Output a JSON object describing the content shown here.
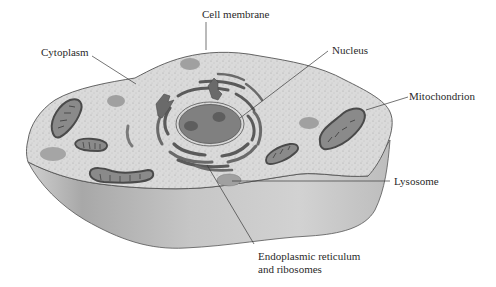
{
  "diagram": {
    "labels": {
      "cell_membrane": "Cell membrane",
      "cytoplasm": "Cytoplasm",
      "nucleus": "Nucleus",
      "mitochondrion": "Mitochondrion",
      "lysosome": "Lysosome",
      "er_line1": "Endoplasmic reticulum",
      "er_line2": "and ribosomes"
    },
    "colors": {
      "cytoplasm_fill": "#d9d9d9",
      "cell_side_fill": "#c4c4c4",
      "cell_side_shadow": "#a9a9a9",
      "outline": "#555555",
      "organelle_fill": "#8c8c8c",
      "organelle_dark": "#5a5a5a",
      "nucleus_fill": "#7f7f7f",
      "nucleolus_fill": "#5e5e5e",
      "lysosome_fill": "#a3a3a3",
      "leader_line": "#3a3a3a",
      "text": "#2a2a2a"
    }
  }
}
